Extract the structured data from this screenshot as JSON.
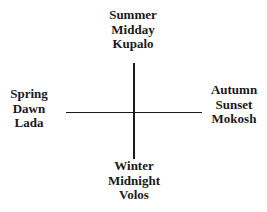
{
  "diagram": {
    "type": "cross-quadrant",
    "top": {
      "lines": [
        "Summer",
        "Midday",
        "Kupalo"
      ]
    },
    "left": {
      "lines": [
        "Spring",
        "Dawn",
        "Lada"
      ]
    },
    "right": {
      "lines": [
        "Autumn",
        "Sunset",
        "Mokosh"
      ]
    },
    "bottom": {
      "lines": [
        "Winter",
        "Midnight",
        "Volos"
      ]
    },
    "colors": {
      "ink": "#1a1a1a",
      "background": "#ffffff"
    }
  }
}
